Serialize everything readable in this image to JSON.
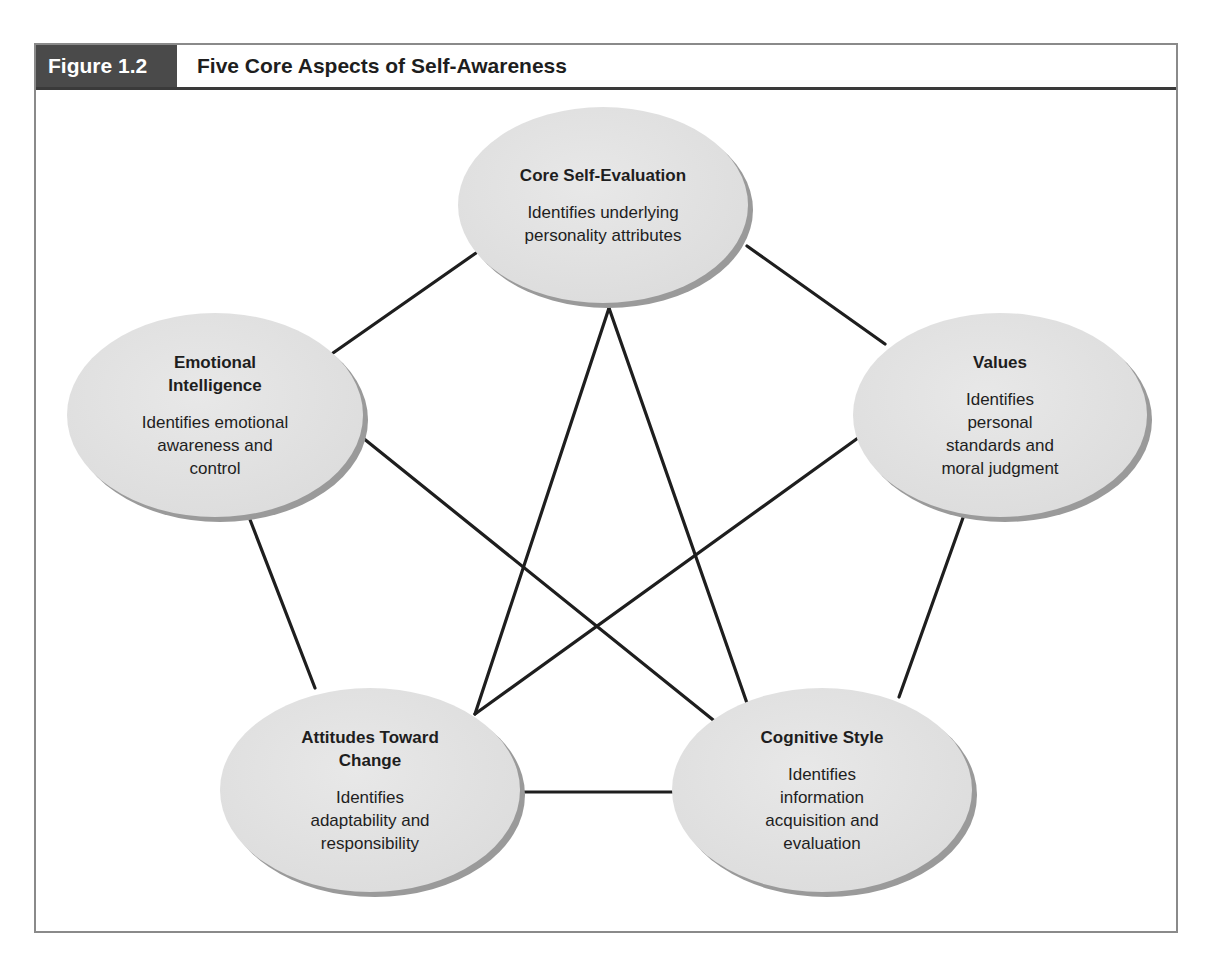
{
  "figure": {
    "label": "Figure 1.2",
    "title": "Five Core Aspects of Self-Awareness"
  },
  "colors": {
    "header_dark": "#4a4a4a",
    "ellipse_fill": "#e2e2e2",
    "ellipse_shadow": "#9a9a9a",
    "line": "#1e1e1e",
    "frame": "#8a8a8a"
  },
  "nodes": [
    {
      "id": "core-self-evaluation",
      "title": "Core Self-Evaluation",
      "description": "Identifies underlying personality attributes",
      "lines": [
        "Identifies underlying",
        "personality attributes"
      ]
    },
    {
      "id": "emotional-intelligence",
      "title": "Emotional Intelligence",
      "title_lines": [
        "Emotional",
        "Intelligence"
      ],
      "description": "Identifies emotional awareness and control",
      "lines": [
        "Identifies emotional",
        "awareness and",
        "control"
      ]
    },
    {
      "id": "values",
      "title": "Values",
      "description": "Identifies personal standards and moral judgment",
      "lines": [
        "Identifies",
        "personal",
        "standards and",
        "moral judgment"
      ]
    },
    {
      "id": "attitudes-toward-change",
      "title": "Attitudes Toward Change",
      "title_lines": [
        "Attitudes Toward",
        "Change"
      ],
      "description": "Identifies adaptability and responsibility",
      "lines": [
        "Identifies",
        "adaptability and",
        "responsibility"
      ]
    },
    {
      "id": "cognitive-style",
      "title": "Cognitive Style",
      "description": "Identifies information acquisition and evaluation",
      "lines": [
        "Identifies",
        "information",
        "acquisition and",
        "evaluation"
      ]
    }
  ],
  "connections": [
    [
      "core-self-evaluation",
      "emotional-intelligence"
    ],
    [
      "core-self-evaluation",
      "values"
    ],
    [
      "core-self-evaluation",
      "attitudes-toward-change"
    ],
    [
      "core-self-evaluation",
      "cognitive-style"
    ],
    [
      "emotional-intelligence",
      "cognitive-style"
    ],
    [
      "values",
      "attitudes-toward-change"
    ],
    [
      "emotional-intelligence",
      "attitudes-toward-change"
    ],
    [
      "values",
      "cognitive-style"
    ],
    [
      "attitudes-toward-change",
      "cognitive-style"
    ]
  ]
}
